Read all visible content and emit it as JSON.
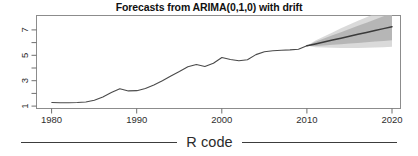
{
  "figure": {
    "title": "Forecasts from ARIMA(0,1,0) with drift",
    "caption": "R code"
  },
  "colors": {
    "frame": "#8c8c8c",
    "series_line": "#4a4a4a",
    "forecast_line": "#3a3a3a",
    "band_95": "#d5d5d5",
    "band_80": "#b0b0b0",
    "text": "#1a1a1a",
    "background": "#ffffff"
  },
  "chart_data": {
    "type": "line",
    "title": "Forecasts from ARIMA(0,1,0) with drift",
    "xlabel": "",
    "ylabel": "",
    "xlim": [
      1978.2,
      2021.0
    ],
    "ylim": [
      0.55,
      7.85
    ],
    "xticks": [
      1980,
      1990,
      2000,
      2010,
      2020
    ],
    "xticklabels": [
      "1980",
      "1990",
      "2000",
      "2010",
      "2020"
    ],
    "yticks": [
      1,
      2,
      3,
      4,
      5,
      6,
      7
    ],
    "yticklabels": [
      "1",
      "",
      "3",
      "",
      "5",
      "",
      "7"
    ],
    "grid": false,
    "legend": null,
    "series": [
      {
        "name": "observed",
        "type": "line",
        "x": [
          1980,
          1981,
          1982,
          1983,
          1984,
          1985,
          1986,
          1987,
          1988,
          1989,
          1990,
          1991,
          1992,
          1993,
          1994,
          1995,
          1996,
          1997,
          1998,
          1999,
          2000,
          2001,
          2002,
          2003,
          2004,
          2005,
          2006,
          2007,
          2008,
          2009,
          2010
        ],
        "values": [
          1.02,
          1.0,
          1.0,
          1.02,
          1.06,
          1.2,
          1.45,
          1.8,
          2.1,
          1.93,
          1.95,
          2.12,
          2.4,
          2.72,
          3.1,
          3.45,
          3.82,
          4.0,
          3.85,
          4.1,
          4.55,
          4.4,
          4.3,
          4.38,
          4.78,
          5.0,
          5.08,
          5.12,
          5.15,
          5.2,
          5.48
        ]
      },
      {
        "name": "point forecast",
        "type": "line",
        "x": [
          2011,
          2012,
          2013,
          2014,
          2015,
          2016,
          2017,
          2018,
          2019,
          2020
        ],
        "values": [
          5.62,
          5.77,
          5.92,
          6.07,
          6.22,
          6.37,
          6.52,
          6.67,
          6.82,
          6.97
        ]
      },
      {
        "name": "80% prediction interval",
        "type": "band",
        "x": [
          2011,
          2012,
          2013,
          2014,
          2015,
          2016,
          2017,
          2018,
          2019,
          2020
        ],
        "lower": [
          5.45,
          5.5,
          5.55,
          5.6,
          5.65,
          5.7,
          5.75,
          5.8,
          5.85,
          5.9
        ],
        "upper": [
          5.79,
          6.04,
          6.29,
          6.54,
          6.79,
          7.04,
          7.29,
          7.54,
          7.79,
          8.04
        ]
      },
      {
        "name": "95% prediction interval",
        "type": "band",
        "x": [
          2011,
          2012,
          2013,
          2014,
          2015,
          2016,
          2017,
          2018,
          2019,
          2020
        ],
        "lower": [
          5.36,
          5.34,
          5.32,
          5.3,
          5.3,
          5.3,
          5.32,
          5.34,
          5.36,
          5.4
        ],
        "upper": [
          5.88,
          6.2,
          6.52,
          6.84,
          7.14,
          7.44,
          7.72,
          8.0,
          8.28,
          8.54
        ]
      }
    ]
  }
}
